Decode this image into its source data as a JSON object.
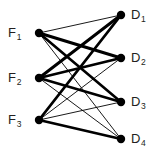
{
  "figure": {
    "type": "bipartite-graph",
    "background_color": "#ffffff",
    "node_color": "#000000",
    "edge_color": "#000000",
    "label_color": "#231f20",
    "width": 157,
    "height": 160
  },
  "left_nodes": [
    {
      "id": "F1",
      "letter": "F",
      "subscript": "1",
      "x": 39,
      "y": 33,
      "label_x": 8,
      "label_y": 26
    },
    {
      "id": "F2",
      "letter": "F",
      "subscript": "2",
      "x": 39,
      "y": 78,
      "label_x": 8,
      "label_y": 71
    },
    {
      "id": "F3",
      "letter": "F",
      "subscript": "3",
      "x": 39,
      "y": 120,
      "label_x": 8,
      "label_y": 113
    }
  ],
  "right_nodes": [
    {
      "id": "D1",
      "letter": "D",
      "subscript": "1",
      "x": 121,
      "y": 15,
      "label_x": 131,
      "label_y": 8
    },
    {
      "id": "D2",
      "letter": "D",
      "subscript": "2",
      "x": 121,
      "y": 58,
      "label_x": 131,
      "label_y": 51
    },
    {
      "id": "D3",
      "letter": "D",
      "subscript": "3",
      "x": 121,
      "y": 102,
      "label_x": 131,
      "label_y": 95
    },
    {
      "id": "D4",
      "letter": "D",
      "subscript": "4",
      "x": 121,
      "y": 139,
      "label_x": 131,
      "label_y": 132
    }
  ],
  "node_radius": 4.2,
  "edges": [
    {
      "from": "F1",
      "to": "D1",
      "weight": 0.9
    },
    {
      "from": "F1",
      "to": "D2",
      "weight": 3.0
    },
    {
      "from": "F1",
      "to": "D3",
      "weight": 2.6
    },
    {
      "from": "F1",
      "to": "D4",
      "weight": 0.9
    },
    {
      "from": "F2",
      "to": "D1",
      "weight": 3.0
    },
    {
      "from": "F2",
      "to": "D2",
      "weight": 2.8
    },
    {
      "from": "F2",
      "to": "D3",
      "weight": 2.6
    },
    {
      "from": "F2",
      "to": "D4",
      "weight": 0.9
    },
    {
      "from": "F3",
      "to": "D1",
      "weight": 2.8
    },
    {
      "from": "F3",
      "to": "D2",
      "weight": 0.9
    },
    {
      "from": "F3",
      "to": "D3",
      "weight": 0.9
    },
    {
      "from": "F3",
      "to": "D4",
      "weight": 2.8
    }
  ],
  "chart_data": {
    "type": "diagram",
    "title": "",
    "left_set_label": "F",
    "right_set_label": "D",
    "left_vertices": [
      "F1",
      "F2",
      "F3"
    ],
    "right_vertices": [
      "D1",
      "D2",
      "D3",
      "D4"
    ],
    "edge_list": [
      [
        "F1",
        "D1"
      ],
      [
        "F1",
        "D2"
      ],
      [
        "F1",
        "D3"
      ],
      [
        "F1",
        "D4"
      ],
      [
        "F2",
        "D1"
      ],
      [
        "F2",
        "D2"
      ],
      [
        "F2",
        "D3"
      ],
      [
        "F2",
        "D4"
      ],
      [
        "F3",
        "D1"
      ],
      [
        "F3",
        "D2"
      ],
      [
        "F3",
        "D3"
      ],
      [
        "F3",
        "D4"
      ]
    ],
    "edge_weights": [
      0.9,
      3.0,
      2.6,
      0.9,
      3.0,
      2.8,
      2.6,
      0.9,
      2.8,
      0.9,
      0.9,
      2.8
    ]
  }
}
